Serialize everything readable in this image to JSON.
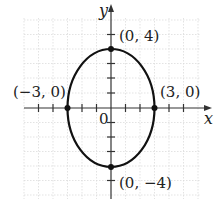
{
  "diagram": {
    "type": "ellipse-graph",
    "equation_semi_axes": {
      "a": 3,
      "b": 4
    },
    "axes": {
      "x_label": "x",
      "y_label": "y",
      "origin_label": "0"
    },
    "points": [
      {
        "label": "(0, 4)",
        "x": 0,
        "y": 4
      },
      {
        "label": "(−3, 0)",
        "x": -3,
        "y": 0
      },
      {
        "label": "(3, 0)",
        "x": 3,
        "y": 0
      },
      {
        "label": "(0, −4)",
        "x": 0,
        "y": -4
      }
    ],
    "colors": {
      "curve": "#111111",
      "grid": "#dcdcdc",
      "axes": "#333333"
    }
  }
}
